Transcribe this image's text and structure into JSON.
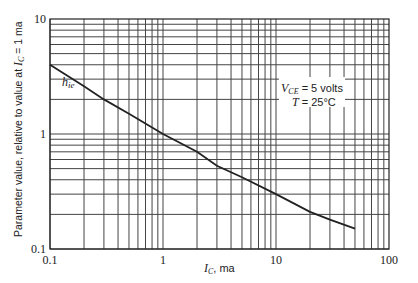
{
  "chart_data": {
    "type": "line",
    "title": "",
    "xlabel": "I_C, ma",
    "xlabel_parts": {
      "var": "I",
      "sub": "C",
      "unit": ", ma"
    },
    "ylabel": "Parameter value, relative to value at I_C = 1 ma",
    "ylabel_parts": {
      "pre": "Parameter value, relative to value at ",
      "var": "I",
      "sub": "C",
      "post": " = 1 ma"
    },
    "xscale": "log",
    "yscale": "log",
    "xlim": [
      0.1,
      100
    ],
    "ylim": [
      0.1,
      10
    ],
    "x_ticks": [
      "0.1",
      "1",
      "10",
      "100"
    ],
    "y_ticks": [
      "0.1",
      "1",
      "10"
    ],
    "grid": true,
    "series": [
      {
        "name": "h_ie",
        "label_parts": {
          "var": "h",
          "sub": "ie"
        },
        "x": [
          0.1,
          0.2,
          0.3,
          0.5,
          1,
          2,
          3,
          5,
          10,
          20,
          30,
          50
        ],
        "values": [
          4.0,
          2.6,
          2.0,
          1.5,
          1.0,
          0.7,
          0.53,
          0.42,
          0.3,
          0.21,
          0.18,
          0.15
        ]
      }
    ],
    "annotations": [
      {
        "text": "V_CE = 5 volts",
        "parts": {
          "var": "V",
          "sub": "CE",
          "rest": " = 5 volts"
        }
      },
      {
        "text": "T = 25°C",
        "parts": {
          "var": "T",
          "rest": " = 25°C"
        }
      }
    ]
  }
}
